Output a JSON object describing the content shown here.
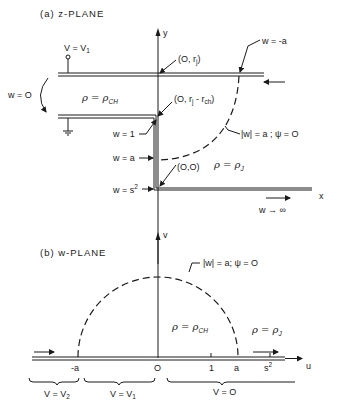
{
  "panel_a": {
    "title": "(a)  z-PLANE",
    "axis_y": "y",
    "axis_x": "x",
    "voltage_top": "V = V",
    "voltage_top_sub": "1",
    "w_zero_left": "w = O",
    "rho_channel": "ρ = ρ",
    "rho_channel_sub": "CH",
    "rho_jet": "ρ = ρ",
    "rho_jet_sub": "J",
    "point_top": "(O, r",
    "point_top_sub": "j",
    "point_top_end": ")",
    "point_mid": "(O, r",
    "point_mid_sub1": "j",
    "point_mid_minus": " - r",
    "point_mid_sub2": "ch",
    "point_mid_end": ")",
    "point_origin": "(O,O)",
    "w_minus_a": "w = -a",
    "w_one": "w = 1",
    "w_a": "w = a",
    "w_s2": "w = s",
    "w_s2_sup": "2",
    "arc_label": "|w| = a ; ψ = O",
    "w_inf": "w → ∞"
  },
  "panel_b": {
    "title": "(b)  w-PLANE",
    "axis_v": "v",
    "axis_u": "u",
    "arc_label": "|w| = a;  ψ = O",
    "rho_channel": "ρ = ρ",
    "rho_channel_sub": "CH",
    "rho_jet": "ρ = ρ",
    "rho_jet_sub": "J",
    "tick_neg_a": "-a",
    "tick_zero": "O",
    "tick_one": "1",
    "tick_a": "a",
    "tick_s2": "s",
    "tick_s2_sup": "2",
    "brace_v2": "V = V",
    "brace_v2_sub": "2",
    "brace_v1": "V = V",
    "brace_v1_sub": "1",
    "brace_v0": "V = O"
  }
}
